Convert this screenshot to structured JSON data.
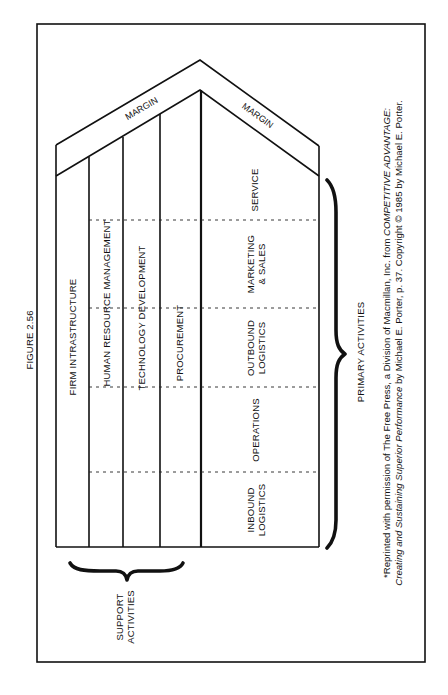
{
  "figure": {
    "label": "FIGURE 2.56",
    "orientation": "rotated 90deg counter-clockwise"
  },
  "diagram": {
    "margin_labels": [
      "MARGIN",
      "MARGIN"
    ],
    "support_activities": {
      "group_label_line1": "SUPPORT",
      "group_label_line2": "ACTIVITIES",
      "items": [
        {
          "label": "FIRM INTRASTRUCTURE"
        },
        {
          "label": "HUMAN RESOURCE MANAGEMENT"
        },
        {
          "label": "TECHNOLOGY DEVELOPMENT"
        },
        {
          "label": "PROCUREMENT"
        }
      ]
    },
    "primary_activities": {
      "group_label": "PRIMARY ACTIVITIES",
      "items": [
        {
          "line1": "INBOUND",
          "line2": "LOGISTICS"
        },
        {
          "line1": "OPERATIONS",
          "line2": ""
        },
        {
          "line1": "OUTBOUND",
          "line2": "LOGISTICS"
        },
        {
          "line1": "MARKETING",
          "line2": "& SALES"
        },
        {
          "line1": "SERVICE",
          "line2": ""
        }
      ]
    }
  },
  "citation": {
    "line1_prefix": "*Reprinted with permission of The Free Press, a Division of Macmillan, Inc. from ",
    "line1_italic": "COMPETITIVE ADVANTAGE:",
    "line2_italic": "Creating and Sustaining Superior Performance",
    "line2_suffix": " by Michael E. Porter, p. 37. Copyright © 1985 by Michael E. Porter."
  },
  "colors": {
    "ink": "#111111",
    "paper": "#ffffff"
  }
}
